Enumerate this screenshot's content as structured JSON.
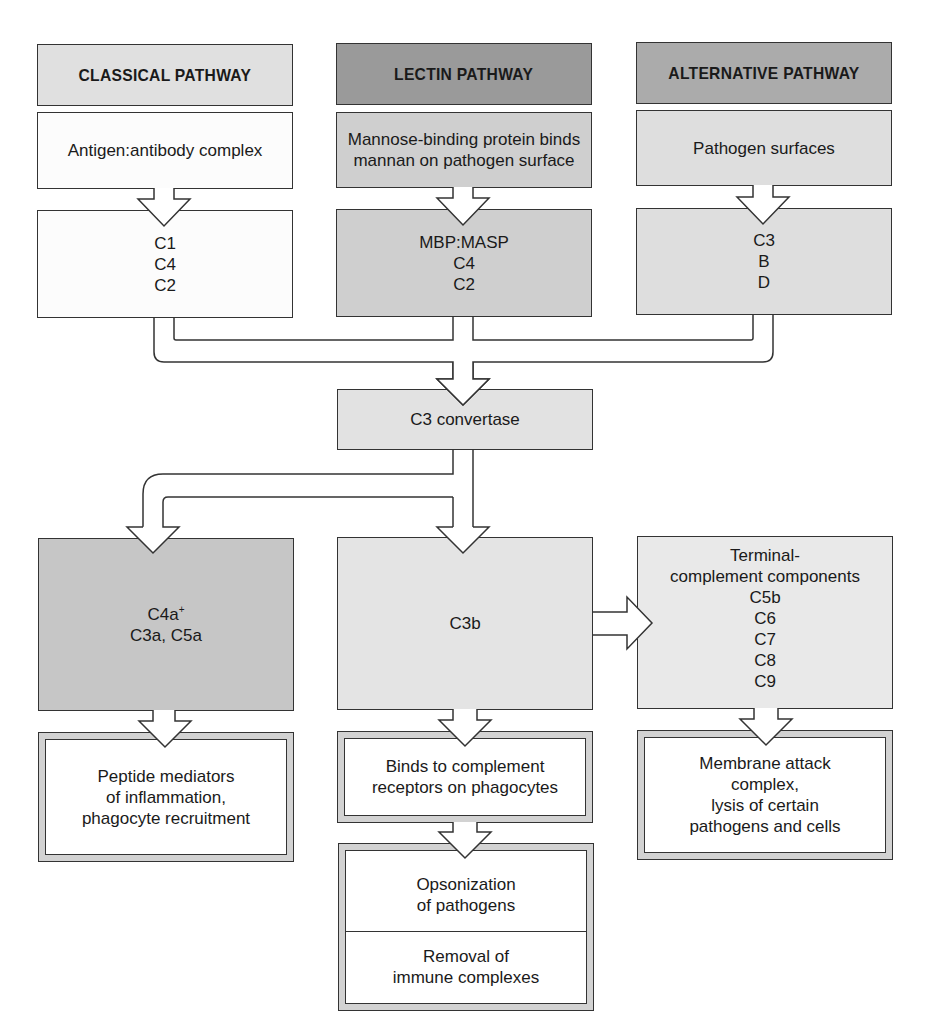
{
  "colors": {
    "header_light": "#e0e0e0",
    "header_dark": "#9e9e9e",
    "header_medium": "#ababab",
    "fill_white": "#ffffff",
    "fill_light": "#e6e6e6",
    "fill_medium": "#c4c4c4",
    "fill_lighter": "#e9e9e9",
    "outline": "#333333",
    "double_border": "#d2d2d2"
  },
  "pathways": [
    {
      "header": "CLASSICAL PATHWAY",
      "trigger": [
        "Antigen:antibody complex"
      ],
      "components": [
        "C1",
        "C4",
        "C2"
      ]
    },
    {
      "header": "LECTIN PATHWAY",
      "trigger": [
        "Mannose-binding protein binds",
        "mannan on pathogen surface"
      ],
      "components": [
        "MBP:MASP",
        "C4",
        "C2"
      ]
    },
    {
      "header": "ALTERNATIVE PATHWAY",
      "trigger": [
        "Pathogen surfaces"
      ],
      "components": [
        "C3",
        "B",
        "D"
      ]
    }
  ],
  "convergence": {
    "label": "C3 convertase"
  },
  "products": {
    "mediators": {
      "line1_main": "C4a",
      "line1_sup": "+",
      "line2": "C3a, C5a"
    },
    "c3b": {
      "label": "C3b"
    },
    "terminal": [
      "Terminal-",
      "complement components",
      "C5b",
      "C6",
      "C7",
      "C8",
      "C9"
    ]
  },
  "outcomes": {
    "inflammation": [
      "Peptide mediators",
      "of inflammation,",
      "phagocyte recruitment"
    ],
    "receptors": [
      "Binds to complement",
      "receptors on phagocytes"
    ],
    "opsonization": [
      "Opsonization",
      "of pathogens"
    ],
    "removal": [
      "Removal of",
      "immune complexes"
    ],
    "mac": [
      "Membrane attack",
      "complex,",
      "lysis of certain",
      "pathogens and cells"
    ]
  }
}
